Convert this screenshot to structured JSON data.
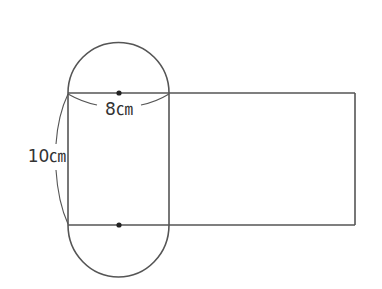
{
  "diagram": {
    "type": "cylinder-net",
    "labels": {
      "diameter": "8㎝",
      "height": "10㎝"
    },
    "values": {
      "diameter_cm": 8,
      "height_cm": 10
    },
    "colors": {
      "stroke": "#555555",
      "dot": "#222222",
      "text": "#333333"
    }
  }
}
